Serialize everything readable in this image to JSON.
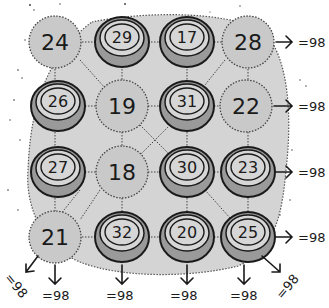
{
  "puzzle": {
    "type": "magic-square-4x4",
    "magic_sum_label": "=98",
    "magic_sum": 98,
    "colors": {
      "background": "#ffffff",
      "blob": "#d4d4d4",
      "plain_circle": "#c9c9c9",
      "ring_outer": "#9a9a9a",
      "ring_inner": "#d6d6d6",
      "ink": "#1a1a1a"
    },
    "grid": [
      [
        {
          "value": "24",
          "style": "plain"
        },
        {
          "value": "29",
          "style": "ring"
        },
        {
          "value": "17",
          "style": "ring"
        },
        {
          "value": "28",
          "style": "plain"
        }
      ],
      [
        {
          "value": "26",
          "style": "ring"
        },
        {
          "value": "19",
          "style": "plain"
        },
        {
          "value": "31",
          "style": "ring"
        },
        {
          "value": "22",
          "style": "plain"
        }
      ],
      [
        {
          "value": "27",
          "style": "ring"
        },
        {
          "value": "18",
          "style": "plain"
        },
        {
          "value": "30",
          "style": "ring"
        },
        {
          "value": "23",
          "style": "ring"
        }
      ],
      [
        {
          "value": "21",
          "style": "plain"
        },
        {
          "value": "32",
          "style": "ring"
        },
        {
          "value": "20",
          "style": "ring"
        },
        {
          "value": "25",
          "style": "ring"
        }
      ]
    ],
    "row_sums": [
      "=98",
      "=98",
      "=98",
      "=98"
    ],
    "column_sums": [
      "=98",
      "=98",
      "=98",
      "=98"
    ],
    "diagonal_sums": {
      "anti_diagonal": "=98",
      "main_diagonal": "=98"
    }
  }
}
